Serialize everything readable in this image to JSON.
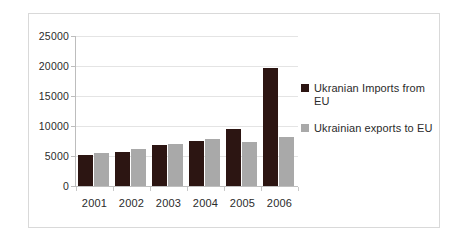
{
  "chart_data": {
    "type": "bar",
    "title": "",
    "xlabel": "",
    "ylabel": "",
    "categories": [
      "2001",
      "2002",
      "2003",
      "2004",
      "2005",
      "2006"
    ],
    "ylim": [
      0,
      25000
    ],
    "yticks": [
      "0",
      "5000",
      "10000",
      "15000",
      "20000",
      "25000"
    ],
    "ytick_values": [
      0,
      5000,
      10000,
      15000,
      20000,
      25000
    ],
    "grid": true,
    "legend_position": "right",
    "series": [
      {
        "name": "Ukranian Imports from EU",
        "color": "#2c1512",
        "values": [
          5200,
          5700,
          6800,
          7500,
          9500,
          19700
        ]
      },
      {
        "name": "Ukrainian exports to EU",
        "color": "#a9a9a9",
        "values": [
          5500,
          6100,
          7000,
          7800,
          7350,
          8100
        ]
      }
    ]
  },
  "legend": {
    "items": [
      {
        "label": "Ukranian Imports from EU",
        "swatch": "legend-swatch-imports"
      },
      {
        "label": "Ukrainian exports to EU",
        "swatch": "legend-swatch-exports"
      }
    ]
  }
}
